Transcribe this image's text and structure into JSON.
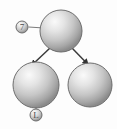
{
  "diagram": {
    "type": "tree-diagram",
    "background_color": "#fdfdfd",
    "sphere_color_light": "#f2f2f2",
    "sphere_color_mid": "#c9c9c9",
    "sphere_color_dark": "#8e8e8e",
    "sphere_outline_color": "#6b6b6b",
    "connector_color": "#7a7a7a",
    "arrow_color": "#3a3a3a",
    "label_text_color": "#4a4a4a",
    "nodes": [
      {
        "id": "root",
        "name": "parent-sphere",
        "cx": 61,
        "cy": 31,
        "r": 21
      },
      {
        "id": "child-left",
        "name": "child-sphere-left",
        "cx": 36,
        "cy": 85,
        "r": 23
      },
      {
        "id": "child-right",
        "name": "child-sphere-right",
        "cx": 90,
        "cy": 85,
        "r": 22
      }
    ],
    "edges": [
      {
        "from": "root",
        "to": "child-left",
        "style": "arrow"
      },
      {
        "from": "root",
        "to": "child-right",
        "style": "arrow"
      }
    ],
    "callouts": [
      {
        "id": "callout-top",
        "name": "callout-marker-7",
        "label": "7",
        "cx": 22,
        "cy": 27,
        "r": 6,
        "leader_to": "root"
      },
      {
        "id": "callout-bottom",
        "name": "callout-marker-l",
        "label": "L",
        "cx": 36,
        "cy": 115,
        "r": 6,
        "leader_to": "child-left"
      }
    ]
  }
}
